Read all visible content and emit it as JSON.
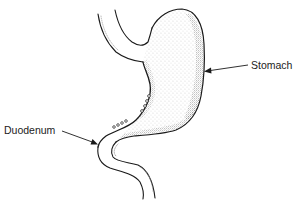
{
  "diagram": {
    "style": "black line drawing with stipple shading",
    "colors": {
      "background": "#ffffff",
      "line": "#1a1a1a",
      "stipple": "#555555"
    },
    "labels": [
      {
        "id": "stomach",
        "text": "Stomach",
        "points_to": "greater curvature of stomach"
      },
      {
        "id": "duodenum",
        "text": "Duodenum",
        "points_to": "duodenal bulb / pylorus"
      }
    ]
  }
}
